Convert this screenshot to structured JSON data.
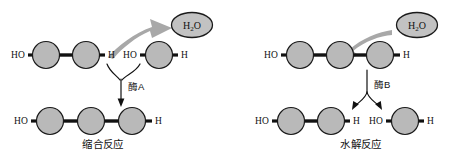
{
  "figure": {
    "kind": "biochemistry-reaction-diagram",
    "background_color": "#ffffff",
    "width": 453,
    "height": 157
  },
  "style": {
    "monomer_fill": "#b9b9b9",
    "monomer_stroke": "#1a1a1a",
    "bond_color": "#111111",
    "water_fill": "#c2c2c2",
    "gray_arrow_color": "#a8a8a8",
    "text_color": "#111111"
  },
  "left_panel": {
    "name": "condensation",
    "caption": "缩合反应",
    "enzyme_label": "酶A",
    "water": {
      "formula_main": "H",
      "formula_sub": "2",
      "formula_tail": "O",
      "full": "H2O",
      "role": "released"
    },
    "reactants": [
      {
        "left_label": "HO",
        "right_label": "H",
        "monomer_count": 2
      },
      {
        "left_label": "HO",
        "right_label": "H",
        "monomer_count": 1
      }
    ],
    "product": {
      "left_label": "HO",
      "right_label": "H",
      "monomer_count": 3
    }
  },
  "right_panel": {
    "name": "hydrolysis",
    "caption": "水解反应",
    "enzyme_label": "酶B",
    "water": {
      "formula_main": "H",
      "formula_sub": "2",
      "formula_tail": "O",
      "full": "H2O",
      "role": "consumed"
    },
    "reactant": {
      "left_label": "HO",
      "right_label": "H",
      "monomer_count": 3
    },
    "products": [
      {
        "left_label": "HO",
        "right_label": "H",
        "monomer_count": 2
      },
      {
        "left_label": "HO",
        "right_label": "H",
        "monomer_count": 1
      }
    ]
  }
}
